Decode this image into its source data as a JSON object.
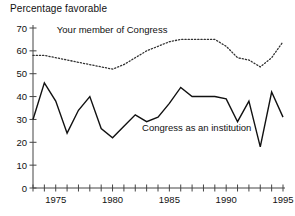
{
  "chart_data": {
    "type": "line",
    "title": "Percentage favorable",
    "xlabel": "",
    "ylabel": "",
    "xlim": [
      1973,
      1995
    ],
    "ylim": [
      0,
      70
    ],
    "yticks": [
      0,
      10,
      20,
      30,
      40,
      50,
      60,
      70
    ],
    "ytick_labels": [
      "0",
      "10",
      "20",
      "30",
      "40",
      "50",
      "60",
      "70"
    ],
    "xticks": [
      1973,
      1974,
      1975,
      1976,
      1977,
      1978,
      1979,
      1980,
      1981,
      1982,
      1983,
      1984,
      1985,
      1986,
      1987,
      1988,
      1989,
      1990,
      1991,
      1992,
      1993,
      1994,
      1995
    ],
    "xtick_labels_shown": [
      "1975",
      "1980",
      "1985",
      "1990",
      "1995"
    ],
    "xtick_labels_shown_values": [
      1975,
      1980,
      1985,
      1990,
      1995
    ],
    "grid": false,
    "legend_position": "inline-annotation",
    "series": [
      {
        "name": "Your member of Congress",
        "style": "dotted",
        "color": "#333333",
        "label_x": 1975.1,
        "label_y": 68,
        "x": [
          1973,
          1974,
          1975,
          1976,
          1977,
          1978,
          1979,
          1980,
          1981,
          1982,
          1983,
          1984,
          1985,
          1986,
          1987,
          1988,
          1989,
          1990,
          1991,
          1992,
          1993,
          1994,
          1995
        ],
        "values": [
          58,
          58,
          57,
          56,
          55,
          54,
          53,
          52,
          54,
          57,
          60,
          62,
          64,
          65,
          65,
          65,
          65,
          62,
          57,
          56,
          53,
          57,
          64
        ]
      },
      {
        "name": "Congress as an institution",
        "style": "solid",
        "color": "#111111",
        "label_x": 1982.6,
        "label_y": 25,
        "x": [
          1973,
          1974,
          1975,
          1976,
          1977,
          1978,
          1979,
          1980,
          1981,
          1982,
          1983,
          1984,
          1985,
          1986,
          1987,
          1988,
          1989,
          1990,
          1991,
          1992,
          1993,
          1994,
          1995
        ],
        "values": [
          30,
          46,
          38,
          24,
          34,
          40,
          26,
          22,
          27,
          32,
          29,
          31,
          37,
          44,
          40,
          40,
          40,
          39,
          29,
          38,
          18,
          42,
          31
        ]
      }
    ]
  }
}
